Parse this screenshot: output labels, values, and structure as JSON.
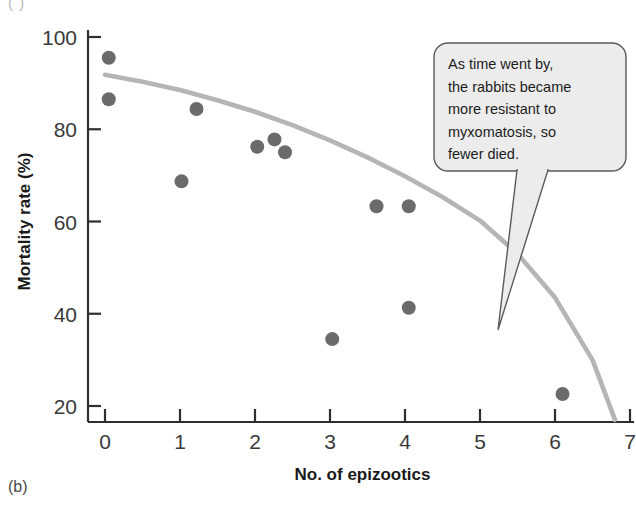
{
  "figure": {
    "panel_label": "(b)",
    "top_corner_mark": "( )"
  },
  "callout": {
    "lines": [
      "As time went by,",
      "the rabbits became",
      "more resistant to",
      "myxomatosis, so",
      "fewer died."
    ],
    "fill_color": "#ececec",
    "border_color": "#5a5a5a"
  },
  "colors": {
    "point_color": "#6b6b6b",
    "curve_color": "#b5b5b5",
    "axis_color": "#2f2f2f"
  },
  "chart_data": {
    "type": "scatter",
    "title": "",
    "xlabel": "No. of epizootics",
    "ylabel": "Mortality rate (%)",
    "xlim": [
      0,
      7
    ],
    "ylim": [
      14,
      103
    ],
    "xticks": [
      "0",
      "1",
      "2",
      "3",
      "4",
      "5",
      "6",
      "7"
    ],
    "xtick_values": [
      0,
      1,
      2,
      3,
      4,
      5,
      6,
      7
    ],
    "yticks": [
      "20",
      "40",
      "60",
      "80",
      "100"
    ],
    "ytick_values": [
      20,
      40,
      60,
      80,
      100
    ],
    "grid": false,
    "legend": "none",
    "points": [
      {
        "x": 0.05,
        "y": 95.5
      },
      {
        "x": 0.05,
        "y": 86.5
      },
      {
        "x": 1.02,
        "y": 68.7
      },
      {
        "x": 1.22,
        "y": 84.4
      },
      {
        "x": 2.03,
        "y": 76.2
      },
      {
        "x": 2.26,
        "y": 77.8
      },
      {
        "x": 2.4,
        "y": 75.0
      },
      {
        "x": 3.03,
        "y": 34.5
      },
      {
        "x": 3.62,
        "y": 63.3
      },
      {
        "x": 4.05,
        "y": 63.3
      },
      {
        "x": 4.05,
        "y": 41.3
      },
      {
        "x": 6.1,
        "y": 22.6
      }
    ],
    "fit_curve": {
      "name": "fitted trend",
      "x": [
        0.0,
        0.5,
        1.0,
        1.5,
        2.0,
        2.5,
        3.0,
        3.5,
        4.0,
        4.5,
        5.0,
        5.5,
        6.0,
        6.5,
        6.8
      ],
      "y": [
        91.8,
        90.3,
        88.5,
        86.3,
        83.8,
        80.9,
        77.6,
        73.9,
        69.8,
        65.3,
        60.2,
        53.0,
        43.5,
        30.0,
        17.0
      ]
    }
  }
}
